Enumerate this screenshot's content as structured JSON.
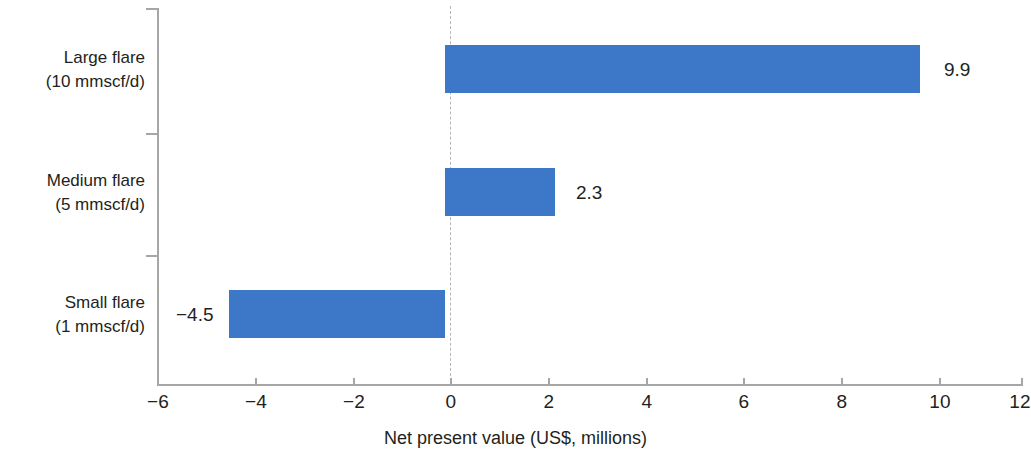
{
  "chart_data": {
    "type": "bar",
    "orientation": "horizontal",
    "title": "",
    "xlabel": "Net present value (US$, millions)",
    "ylabel": "",
    "categories": [
      "Large flare\n(10 mmscf/d)",
      "Medium flare\n(5 mmscf/d)",
      "Small flare\n(1 mmscf/d)"
    ],
    "values": [
      9.9,
      2.3,
      -4.5
    ],
    "value_labels": [
      "9.9",
      "2.3",
      "−4.5"
    ],
    "xlim": [
      -6,
      12
    ],
    "xticks": [
      -6,
      -4,
      -2,
      0,
      2,
      4,
      6,
      8,
      10,
      12
    ],
    "xtick_labels": [
      "−6",
      "−4",
      "−2",
      "0",
      "2",
      "4",
      "6",
      "8",
      "10",
      "12"
    ],
    "grid": false,
    "legend": false,
    "zero_reference_line": true,
    "bar_color": "#3D77C8",
    "axis_color": "#a6a6a6",
    "text_color": "#231f20"
  },
  "categories": [
    {
      "line1": "Large flare",
      "line2": "(10 mmscf/d)",
      "value_label": "9.9"
    },
    {
      "line1": "Medium flare",
      "line2": "(5 mmscf/d)",
      "value_label": "2.3"
    },
    {
      "line1": "Small flare",
      "line2": "(1 mmscf/d)",
      "value_label": "−4.5"
    }
  ],
  "axis": {
    "x_title": "Net present value (US$, millions)",
    "tick_labels": [
      "−6",
      "−4",
      "−2",
      "0",
      "2",
      "4",
      "6",
      "8",
      "10",
      "12"
    ]
  }
}
